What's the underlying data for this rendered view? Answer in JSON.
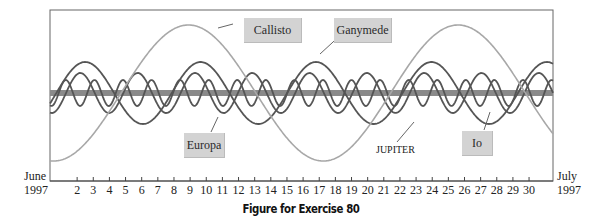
{
  "chart_data": {
    "type": "line",
    "title": "",
    "caption": "Figure for Exercise 80",
    "xlabel": "",
    "ylabel": "",
    "x_start_label": [
      "June",
      "1997"
    ],
    "x_end_label": [
      "July",
      "1997"
    ],
    "x_ticks": [
      2,
      3,
      4,
      5,
      6,
      7,
      8,
      9,
      10,
      11,
      12,
      13,
      14,
      15,
      16,
      17,
      18,
      19,
      20,
      21,
      22,
      23,
      24,
      25,
      26,
      27,
      28,
      29,
      30
    ],
    "xlim": [
      1,
      31
    ],
    "grid": false,
    "legend_position": "inline-callouts",
    "center_line": {
      "name": "JUPITER",
      "color": "#8a8a8a"
    },
    "series": [
      {
        "name": "Io",
        "period_days": 1.77,
        "relative_amplitude": 13,
        "phase_day_of_max": 1.3,
        "color": "#555555"
      },
      {
        "name": "Europa",
        "period_days": 3.55,
        "relative_amplitude": 20,
        "phase_day_of_max": 2.2,
        "color": "#555555"
      },
      {
        "name": "Ganymede",
        "period_days": 7.15,
        "relative_amplitude": 31,
        "phase_day_of_max": 2.5,
        "color": "#555555"
      },
      {
        "name": "Callisto",
        "period_days": 16.7,
        "relative_amplitude": 68,
        "phase_day_of_max": 8.9,
        "color": "#a8a8a8"
      }
    ]
  },
  "labels": {
    "callisto": "Callisto",
    "ganymede": "Ganymede",
    "europa": "Europa",
    "io": "Io",
    "jupiter": "JUPITER",
    "june": "June",
    "june_year": "1997",
    "july": "July",
    "july_year": "1997",
    "caption": "Figure for Exercise 80"
  }
}
